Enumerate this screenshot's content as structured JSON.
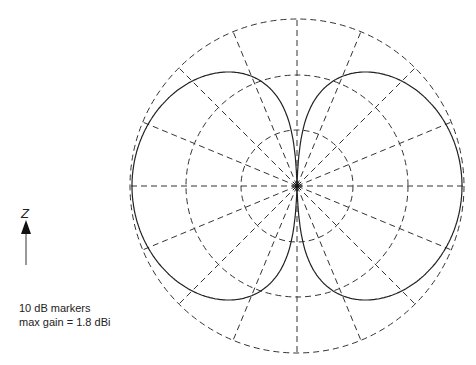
{
  "chart_data": {
    "type": "polar",
    "title": "",
    "pattern": "dipole elevation pattern (sin theta), figure-eight lobes left and right",
    "axis_label": "Z",
    "rings_db": [
      -20,
      -10,
      0
    ],
    "ring_spacing_db": 10,
    "radial_lines_deg": [
      0,
      22.5,
      45,
      67.5,
      90,
      112.5,
      135,
      157.5,
      180,
      202.5,
      225,
      247.5,
      270,
      292.5,
      315,
      337.5
    ],
    "max_gain_dbi": 1.8,
    "series": [
      {
        "name": "gain pattern",
        "shape": "sin(theta), normalized to max gain"
      }
    ]
  },
  "annotations": {
    "line1": "10 dB markers",
    "line2": "max gain = 1.8 dBi"
  },
  "axis": {
    "z_label": "Z"
  }
}
